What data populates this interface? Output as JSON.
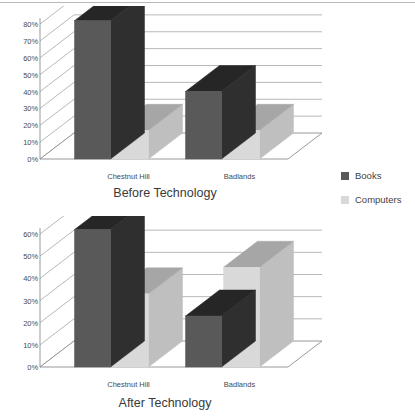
{
  "legend": {
    "items": [
      {
        "label": "Books",
        "color": "#595959"
      },
      {
        "label": "Computers",
        "color": "#d9d9d9"
      }
    ]
  },
  "colors": {
    "books_front": "#595959",
    "books_top": "#262626",
    "books_side": "#2f2f2f",
    "computers_front": "#d9d9d9",
    "computers_top": "#a6a6a6",
    "computers_side": "#bfbfbf",
    "gridline": "#a6a6a6",
    "axis": "#808080",
    "floor": "#ffffff",
    "text": "#4a4a4a"
  },
  "chart_data": [
    {
      "type": "bar",
      "title": "Before Technology",
      "xlabel": "",
      "ylabel": "",
      "categories": [
        "Chestnut Hill",
        "Badlands"
      ],
      "series": [
        {
          "name": "Books",
          "values": [
            82,
            40
          ]
        },
        {
          "name": "Computers",
          "values": [
            17,
            17
          ]
        }
      ],
      "ylim": [
        0,
        80
      ],
      "yticks": [
        "0%",
        "10%",
        "20%",
        "30%",
        "40%",
        "50%",
        "60%",
        "70%",
        "80%"
      ],
      "ytick_values": [
        0,
        10,
        20,
        30,
        40,
        50,
        60,
        70,
        80
      ],
      "grid": true,
      "legend_position": "right",
      "three_d": true
    },
    {
      "type": "bar",
      "title": "After Technology",
      "xlabel": "",
      "ylabel": "",
      "categories": [
        "Chestnut Hill",
        "Badlands"
      ],
      "series": [
        {
          "name": "Books",
          "values": [
            62,
            23
          ]
        },
        {
          "name": "Computers",
          "values": [
            33,
            45
          ]
        }
      ],
      "ylim": [
        0,
        60
      ],
      "yticks": [
        "0%",
        "10%",
        "20%",
        "30%",
        "40%",
        "50%",
        "60%"
      ],
      "ytick_values": [
        0,
        10,
        20,
        30,
        40,
        50,
        60
      ],
      "grid": true,
      "legend_position": "right",
      "three_d": true
    }
  ]
}
